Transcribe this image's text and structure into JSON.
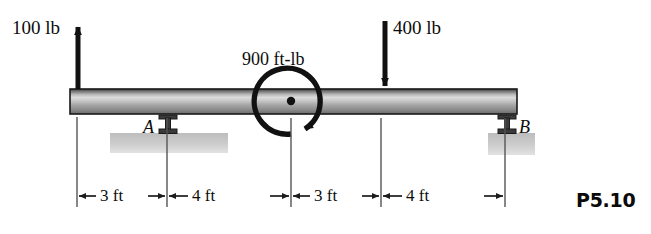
{
  "figure": {
    "number": "P5.10",
    "type": "beam-free-body-diagram"
  },
  "loads": [
    {
      "name": "upward-point-load",
      "label": "100 lb",
      "magnitude": 100,
      "unit": "lb",
      "direction": "up",
      "position_ft": 0
    },
    {
      "name": "downward-point-load",
      "label": "400 lb",
      "magnitude": 400,
      "unit": "lb",
      "direction": "down",
      "position_ft": 10
    }
  ],
  "moment": {
    "label": "900 ft-lb",
    "magnitude": 900,
    "unit": "ft-lb",
    "sense": "counterclockwise",
    "position_ft": 7
  },
  "supports": [
    {
      "name": "support-a",
      "label": "A",
      "type": "pin",
      "position_ft": 3
    },
    {
      "name": "support-b",
      "label": "B",
      "type": "pin",
      "position_ft": 14
    }
  ],
  "dimensions": [
    {
      "label": "3 ft",
      "value": 3,
      "unit": "ft",
      "from_ft": 0,
      "to_ft": 3
    },
    {
      "label": "4 ft",
      "value": 4,
      "unit": "ft",
      "from_ft": 3,
      "to_ft": 7
    },
    {
      "label": "3 ft",
      "value": 3,
      "unit": "ft",
      "from_ft": 7,
      "to_ft": 10
    },
    {
      "label": "4 ft",
      "value": 4,
      "unit": "ft",
      "from_ft": 10,
      "to_ft": 14
    }
  ],
  "beam": {
    "length_ft": 14,
    "label": "beam"
  },
  "colors": {
    "line": "#111111",
    "beam_dark": "#4a4a4a",
    "beam_light": "#d8d8d8",
    "ground": "#b9b9b9",
    "dimension": "#2b2b2b"
  }
}
